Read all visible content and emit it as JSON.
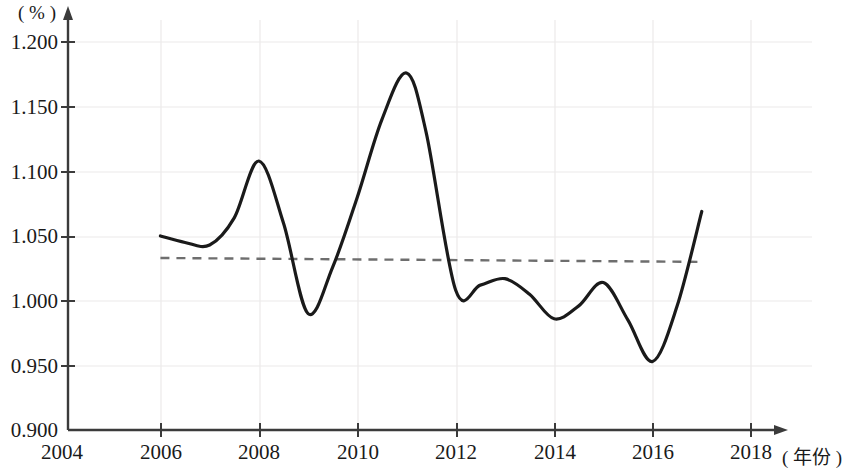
{
  "chart_data": {
    "type": "line",
    "title": "",
    "subtitle": "",
    "xlabel": "( 年份 )",
    "ylabel": "( % )",
    "xlim": [
      2004,
      2018
    ],
    "ylim": [
      0.9,
      1.2
    ],
    "grid": true,
    "legend": null,
    "x_ticks": [
      "2004",
      "2006",
      "2008",
      "2010",
      "2012",
      "2014",
      "2016",
      "2018"
    ],
    "x_tick_values": [
      2004,
      2006,
      2008,
      2010,
      2012,
      2014,
      2016,
      2018
    ],
    "y_ticks": [
      "0.900",
      "0.950",
      "1.000",
      "1.050",
      "1.100",
      "1.150",
      "1.200"
    ],
    "y_tick_values": [
      0.9,
      0.95,
      1.0,
      1.05,
      1.1,
      1.15,
      1.2
    ],
    "series": [
      {
        "name": "ratio-curve",
        "style": "solid",
        "color": "#1a1a1a",
        "x": [
          2006,
          2006.5,
          2007,
          2007.5,
          2008,
          2008.5,
          2009,
          2009.5,
          2010,
          2010.5,
          2011,
          2011.4,
          2012,
          2012.5,
          2013,
          2013.5,
          2014,
          2014.5,
          2015,
          2015.5,
          2016,
          2016.5,
          2017
        ],
        "values": [
          1.05,
          1.045,
          1.043,
          1.064,
          1.108,
          1.06,
          0.99,
          1.026,
          1.08,
          1.14,
          1.176,
          1.13,
          1.008,
          1.012,
          1.017,
          1.005,
          0.986,
          0.996,
          1.014,
          0.985,
          0.953,
          0.996,
          1.069
        ]
      },
      {
        "name": "trend-line",
        "style": "dashed",
        "color": "#6e6e6e",
        "x": [
          2006,
          2017
        ],
        "values": [
          1.033,
          1.03
        ]
      }
    ]
  },
  "axes": {
    "y_unit": "( % )",
    "x_unit": "( 年份 )",
    "x_axis_end_tick": "2018"
  }
}
